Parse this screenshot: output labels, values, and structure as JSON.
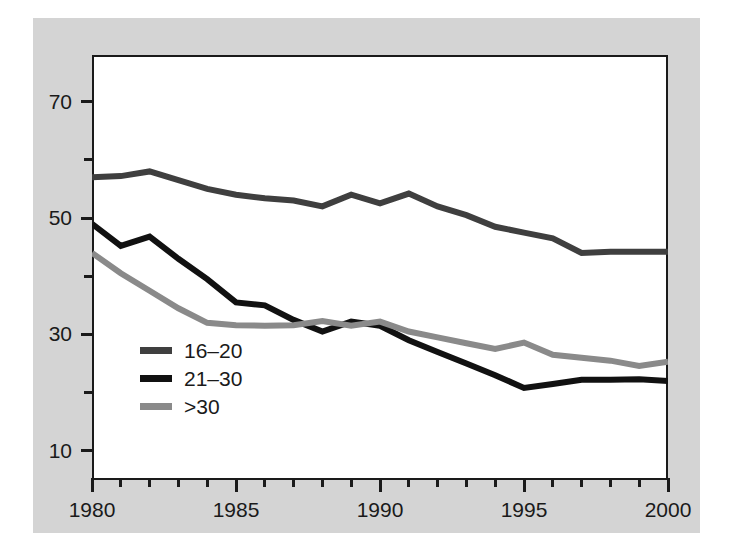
{
  "figure": {
    "background_color": "#d4d4d4",
    "plot_background_color": "#ffffff",
    "frame_color": "#1a1a1a"
  },
  "chart_data": {
    "type": "line",
    "title": "",
    "subtitle": "",
    "xlabel": "",
    "ylabel": "",
    "xlim": [
      1980,
      2000
    ],
    "ylim": [
      5,
      78
    ],
    "grid": false,
    "legend_position": "inside-lower-left",
    "x": [
      1980,
      1981,
      1982,
      1983,
      1984,
      1985,
      1986,
      1987,
      1988,
      1989,
      1990,
      1991,
      1992,
      1993,
      1994,
      1995,
      1996,
      1997,
      1998,
      1999,
      2000
    ],
    "x_major_ticks": [
      1980,
      1985,
      1990,
      1995,
      2000
    ],
    "x_tick_labels": [
      "1980",
      "1985",
      "1990",
      "1995",
      "2000"
    ],
    "x_minor_tick_step": 1,
    "y_major_ticks": [
      10,
      30,
      50,
      70
    ],
    "y_tick_labels": [
      "10",
      "30",
      "50",
      "70"
    ],
    "y_minor_ticks": [
      20,
      40,
      60
    ],
    "series": [
      {
        "name": "16–20",
        "color": "#3f3f3f",
        "values": [
          57.0,
          57.2,
          58.0,
          56.5,
          55.0,
          54.0,
          53.4,
          53.0,
          52.0,
          54.0,
          52.5,
          54.2,
          52.0,
          50.5,
          48.5,
          47.5,
          46.5,
          44.0,
          44.2,
          44.2,
          44.2
        ]
      },
      {
        "name": "21–30",
        "color": "#111111",
        "values": [
          49.0,
          45.2,
          46.8,
          43.0,
          39.5,
          35.5,
          35.0,
          32.5,
          30.5,
          32.2,
          31.5,
          29.0,
          27.0,
          25.0,
          23.0,
          20.8,
          21.5,
          22.2,
          22.2,
          22.3,
          22.0
        ]
      },
      {
        "name": ">30",
        "color": "#8a8a8a",
        "values": [
          44.0,
          40.5,
          37.5,
          34.5,
          32.0,
          31.6,
          31.5,
          31.6,
          32.3,
          31.5,
          32.2,
          30.5,
          29.5,
          28.5,
          27.5,
          28.6,
          26.5,
          26.0,
          25.5,
          24.6,
          25.3
        ]
      }
    ]
  },
  "legend": {
    "items": [
      {
        "label": "16–20",
        "color": "#3f3f3f"
      },
      {
        "label": "21–30",
        "color": "#111111"
      },
      {
        "label": ">30",
        "color": "#8a8a8a"
      }
    ]
  }
}
